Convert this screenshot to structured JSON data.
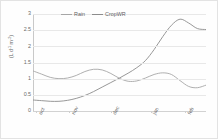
{
  "chart_data": {
    "type": "line",
    "title": "",
    "xlabel": "",
    "ylabel": "(L d-1 m-2)",
    "ylabel_main": "(L d",
    "ylabel_sup1": "-1",
    "ylabel_mid": " m",
    "ylabel_sup2": "-2",
    "ylabel_end": ")",
    "ylim": [
      0,
      3
    ],
    "yticks": [
      0,
      0.5,
      1,
      1.5,
      2,
      2.5,
      3
    ],
    "ytick_labels": [
      "0",
      "0.5",
      "1",
      "1.5",
      "2",
      "2.5",
      "3"
    ],
    "grid": true,
    "legend_position": "top-center",
    "categories": [
      "oct",
      "nov",
      "dec",
      "jan",
      "feb"
    ],
    "xtick_labels": [
      "oct",
      "nov",
      "dec",
      "jan",
      "feb"
    ],
    "xtick_positions": [
      0.02,
      0.21,
      0.45,
      0.68,
      0.88
    ],
    "series": [
      {
        "name": "Rain",
        "color": "#a6a6a6",
        "x": [
          0.0,
          0.05,
          0.1,
          0.15,
          0.2,
          0.25,
          0.3,
          0.35,
          0.4,
          0.45,
          0.5,
          0.55,
          0.6,
          0.65,
          0.7,
          0.75,
          0.8,
          0.85,
          0.9,
          0.95,
          1.0
        ],
        "values": [
          1.24,
          1.14,
          1.04,
          1.0,
          1.02,
          1.1,
          1.22,
          1.29,
          1.27,
          1.16,
          1.01,
          0.92,
          0.93,
          1.02,
          1.13,
          1.18,
          1.13,
          0.94,
          0.76,
          0.72,
          0.8
        ]
      },
      {
        "name": "CropWR",
        "color": "#8c8c8c",
        "x": [
          0.0,
          0.05,
          0.1,
          0.15,
          0.2,
          0.25,
          0.3,
          0.35,
          0.4,
          0.45,
          0.5,
          0.55,
          0.6,
          0.65,
          0.7,
          0.75,
          0.8,
          0.85,
          0.9,
          0.95,
          1.0
        ],
        "values": [
          0.34,
          0.32,
          0.3,
          0.3,
          0.33,
          0.39,
          0.48,
          0.6,
          0.74,
          0.88,
          1.02,
          1.17,
          1.34,
          1.56,
          1.9,
          2.3,
          2.65,
          2.84,
          2.72,
          2.55,
          2.52
        ]
      }
    ],
    "series2_tail": {
      "x": [
        0.9,
        0.93,
        0.96,
        1.0
      ],
      "values": [
        0.76,
        0.9,
        1.1,
        1.33
      ]
    },
    "rain_tail_note": "rain rises to 1.33 at right edge"
  },
  "legend": {
    "items": [
      {
        "label": "Rain",
        "color": "#a6a6a6"
      },
      {
        "label": "CropWR",
        "color": "#8c8c8c"
      }
    ]
  }
}
